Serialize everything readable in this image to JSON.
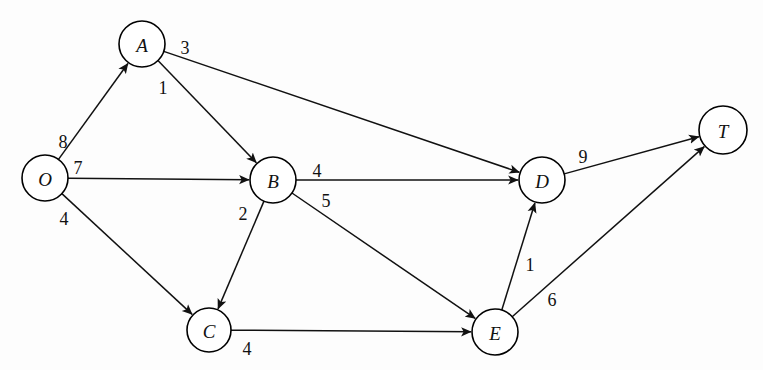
{
  "diagram": {
    "type": "directed-weighted-graph",
    "title": "",
    "background_color": "#fdfdfd",
    "line_color": "#111111",
    "node_fill": "#ffffff",
    "node_stroke": "#000000",
    "canvas": {
      "width": 763,
      "height": 370
    },
    "nodes": [
      {
        "id": "O",
        "label": "O",
        "cx": 45,
        "cy": 178,
        "r": 23
      },
      {
        "id": "A",
        "label": "A",
        "cx": 142,
        "cy": 44,
        "r": 23
      },
      {
        "id": "B",
        "label": "B",
        "cx": 273,
        "cy": 180,
        "r": 23
      },
      {
        "id": "C",
        "label": "C",
        "cx": 209,
        "cy": 330,
        "r": 22
      },
      {
        "id": "D",
        "label": "D",
        "cx": 542,
        "cy": 180,
        "r": 23
      },
      {
        "id": "E",
        "label": "E",
        "cx": 495,
        "cy": 332,
        "r": 23
      },
      {
        "id": "T",
        "label": "T",
        "cx": 723,
        "cy": 130,
        "r": 24
      }
    ],
    "edges": [
      {
        "id": "O-A",
        "from": "O",
        "to": "A",
        "weight": "8",
        "label_x": 63,
        "label_y": 142
      },
      {
        "id": "O-B",
        "from": "O",
        "to": "B",
        "weight": "7",
        "label_x": 78,
        "label_y": 168
      },
      {
        "id": "O-C",
        "from": "O",
        "to": "C",
        "weight": "4",
        "label_x": 64,
        "label_y": 219
      },
      {
        "id": "A-D",
        "from": "A",
        "to": "D",
        "weight": "3",
        "label_x": 185,
        "label_y": 48
      },
      {
        "id": "A-B",
        "from": "A",
        "to": "B",
        "weight": "1",
        "label_x": 163,
        "label_y": 88
      },
      {
        "id": "B-D",
        "from": "B",
        "to": "D",
        "weight": "4",
        "label_x": 317,
        "label_y": 171
      },
      {
        "id": "B-E",
        "from": "B",
        "to": "E",
        "weight": "5",
        "label_x": 326,
        "label_y": 201
      },
      {
        "id": "B-C",
        "from": "B",
        "to": "C",
        "weight": "2",
        "label_x": 243,
        "label_y": 214
      },
      {
        "id": "C-E",
        "from": "C",
        "to": "E",
        "weight": "4",
        "label_x": 247,
        "label_y": 349
      },
      {
        "id": "D-T",
        "from": "D",
        "to": "T",
        "weight": "9",
        "label_x": 583,
        "label_y": 157
      },
      {
        "id": "E-D",
        "from": "E",
        "to": "D",
        "weight": "1",
        "label_x": 530,
        "label_y": 265
      },
      {
        "id": "E-T",
        "from": "E",
        "to": "T",
        "weight": "6",
        "label_x": 552,
        "label_y": 300
      }
    ]
  }
}
